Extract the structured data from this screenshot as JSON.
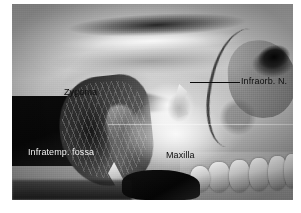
{
  "figure": {
    "kind": "anatomical-dissection-photograph",
    "caption": ""
  },
  "photo": {
    "alt": "Dissected midface specimen, anterolateral view",
    "background_color": "#8e8e8e"
  },
  "annotations": [
    {
      "id": "zygoma",
      "label": "Zygoma",
      "style": "dark",
      "has_leader_line": false
    },
    {
      "id": "infraorb-nerve",
      "label": "Infraorb. N.",
      "style": "dark",
      "has_leader_line": true,
      "leader_color": "#0a0a0a"
    },
    {
      "id": "infratemp-fossa",
      "label": "Infratemp. fossa",
      "style": "light",
      "has_leader_line": false
    },
    {
      "id": "maxilla",
      "label": "Maxilla",
      "style": "dark",
      "has_leader_line": false
    }
  ],
  "colors": {
    "page_background": "#ffffff",
    "label_dark": "#0d0d0d",
    "label_light": "#f2f2f2",
    "leader_line": "#0a0a0a"
  }
}
